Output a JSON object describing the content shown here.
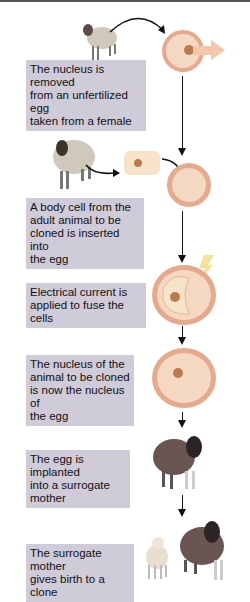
{
  "diagram": {
    "type": "flowchart",
    "title": "",
    "steps": [
      {
        "id": 1,
        "text": "The nucleus is removed from an unfertilized egg taken from a female",
        "lines": [
          "The nucleus is removed",
          "from an unfertilized egg",
          "taken from a female"
        ],
        "image": "sheep-donor-egg"
      },
      {
        "id": 2,
        "text": "A body cell from the adult animal to be cloned is inserted into the egg",
        "lines": [
          "A body cell from the",
          "adult animal to be",
          "cloned is inserted into",
          "the egg"
        ],
        "image": "sheep-body-cell-donor"
      },
      {
        "id": 3,
        "text": "Electrical current is applied to fuse the cells",
        "lines": [
          "Electrical current is",
          "applied to fuse the cells"
        ],
        "image": "electric-bolt-fused-cell"
      },
      {
        "id": 4,
        "text": "The nucleus of the animal to be cloned is now the nucleus of the egg",
        "lines": [
          "The nucleus of the",
          "animal to be cloned",
          "is now the nucleus of",
          "the egg"
        ],
        "image": "egg-with-donor-nucleus"
      },
      {
        "id": 5,
        "text": "The egg is implanted into a surrogate mother",
        "lines": [
          "The egg is implanted",
          "into a surrogate",
          "mother"
        ],
        "image": "surrogate-sheep"
      },
      {
        "id": 6,
        "text": "The surrogate mother gives birth to a clone",
        "lines": [
          "The surrogate mother",
          "gives birth to a clone"
        ],
        "image": "lamb-and-surrogate"
      }
    ],
    "colors": {
      "box_fill": "#cfcbd9",
      "cell_fill": "#f2cfae",
      "cell_border": "#e0a888",
      "nucleus": "#b87a4e",
      "bolt": "#f3e39a",
      "removal_arrow": "#f2c7a7",
      "arrow": "#111111"
    }
  }
}
